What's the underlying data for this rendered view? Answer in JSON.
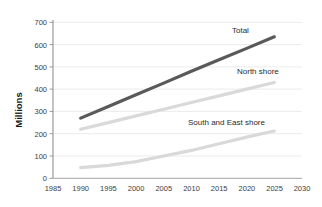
{
  "chart_data": {
    "type": "line",
    "title": "",
    "subtitle": "",
    "xlabel": "",
    "ylabel": "Millions",
    "xlim": [
      1985,
      2030
    ],
    "ylim": [
      0,
      700
    ],
    "x_ticks": [
      1985,
      1990,
      1995,
      2000,
      2005,
      2010,
      2015,
      2020,
      2025,
      2030
    ],
    "y_ticks": [
      0,
      100,
      200,
      300,
      400,
      500,
      600,
      700
    ],
    "grid": "horizontal",
    "legend": "inline-labels",
    "series": [
      {
        "name": "Total",
        "color": "#595959",
        "label_x": 2019,
        "label_y": 660,
        "x": [
          1990,
          1995,
          2000,
          2005,
          2010,
          2015,
          2020,
          2025
        ],
        "values": [
          270,
          322,
          375,
          427,
          480,
          532,
          583,
          635
        ]
      },
      {
        "name": "North shore",
        "color": "#d9d9d9",
        "label_x": 2016,
        "label_y": 455,
        "x": [
          1990,
          1995,
          2000,
          2005,
          2010,
          2015,
          2020,
          2025
        ],
        "values": [
          220,
          250,
          280,
          310,
          340,
          370,
          400,
          430
        ]
      },
      {
        "name": "South and East shore",
        "color": "#d9d9d9",
        "label_x": 2009,
        "label_y": 245,
        "x": [
          1990,
          1995,
          2000,
          2005,
          2010,
          2015,
          2020,
          2025
        ],
        "values": [
          48,
          58,
          75,
          100,
          125,
          155,
          185,
          212
        ]
      }
    ]
  },
  "axis": {
    "y_tick_0": "0",
    "y_tick_1": "100",
    "y_tick_2": "200",
    "y_tick_3": "300",
    "y_tick_4": "400",
    "y_tick_5": "500",
    "y_tick_6": "600",
    "y_tick_7": "700",
    "x_tick_0": "1985",
    "x_tick_1": "1990",
    "x_tick_2": "1995",
    "x_tick_3": "2000",
    "x_tick_4": "2005",
    "x_tick_5": "2010",
    "x_tick_6": "2015",
    "x_tick_7": "2020",
    "x_tick_8": "2025",
    "x_tick_9": "2030"
  },
  "labels": {
    "y_axis_title": "Millions",
    "series_total": "Total",
    "series_north": "North shore",
    "series_south_east": "South and East shore"
  },
  "colors": {
    "total_line": "#595959",
    "light_line": "#d9d9d9",
    "axis": "#808080",
    "grid": "#ebebeb",
    "tick_text": "#3d3d3d"
  }
}
